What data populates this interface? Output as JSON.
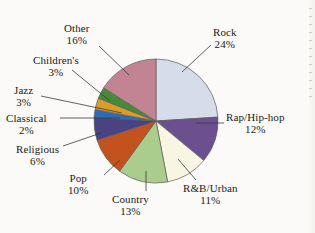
{
  "chart_data": {
    "type": "pie",
    "title": "",
    "subtitle": "",
    "xlabel": "",
    "ylabel": "",
    "legend_position": "none",
    "labels_position": "outside-with-leader-lines",
    "grid": false,
    "start_angle_deg": 0,
    "direction": "clockwise",
    "units": "percent",
    "categories": [
      "Rock",
      "Rap/Hip-hop",
      "R&B/Urban",
      "Country",
      "Pop",
      "Religious",
      "Classical",
      "Jazz",
      "Children's",
      "Other"
    ],
    "values": [
      24,
      12,
      11,
      13,
      10,
      6,
      2,
      3,
      3,
      16
    ],
    "value_labels": [
      "24%",
      "12%",
      "11%",
      "13%",
      "10%",
      "6%",
      "2%",
      "3%",
      "3%",
      "16%"
    ],
    "colors": [
      "#d7dcea",
      "#6b4f8f",
      "#f8f5e2",
      "#aacd8e",
      "#c4521e",
      "#494383",
      "#2a6bbf",
      "#dc9c2c",
      "#468b35",
      "#c28393"
    ],
    "slices": [
      {
        "label": "Rock",
        "value": 24,
        "value_label": "24%",
        "color": "#d7dcea"
      },
      {
        "label": "Rap/Hip-hop",
        "value": 12,
        "value_label": "12%",
        "color": "#6b4f8f"
      },
      {
        "label": "R&B/Urban",
        "value": 11,
        "value_label": "11%",
        "color": "#f8f5e2"
      },
      {
        "label": "Country",
        "value": 13,
        "value_label": "13%",
        "color": "#aacd8e"
      },
      {
        "label": "Pop",
        "value": 10,
        "value_label": "10%",
        "color": "#c4521e"
      },
      {
        "label": "Religious",
        "value": 6,
        "value_label": "6%",
        "color": "#494383"
      },
      {
        "label": "Classical",
        "value": 2,
        "value_label": "2%",
        "color": "#2a6bbf"
      },
      {
        "label": "Jazz",
        "value": 3,
        "value_label": "3%",
        "color": "#dc9c2c"
      },
      {
        "label": "Children's",
        "value": 3,
        "value_label": "3%",
        "color": "#468b35"
      },
      {
        "label": "Other",
        "value": 16,
        "value_label": "16%",
        "color": "#c28393"
      }
    ]
  },
  "labels": {
    "rock": {
      "name": "Rock",
      "pct": "24%"
    },
    "rap": {
      "name": "Rap/Hip-hop",
      "pct": "12%"
    },
    "rnb": {
      "name": "R&B/Urban",
      "pct": "11%"
    },
    "country": {
      "name": "Country",
      "pct": "13%"
    },
    "pop": {
      "name": "Pop",
      "pct": "10%"
    },
    "religious": {
      "name": "Religious",
      "pct": "6%"
    },
    "classical": {
      "name": "Classical",
      "pct": "2%"
    },
    "jazz": {
      "name": "Jazz",
      "pct": "3%"
    },
    "childrens": {
      "name": "Children's",
      "pct": "3%"
    },
    "other": {
      "name": "Other",
      "pct": "16%"
    }
  },
  "background_color": "#fbfaf8",
  "slice_outline_color": "#5d5d5d"
}
